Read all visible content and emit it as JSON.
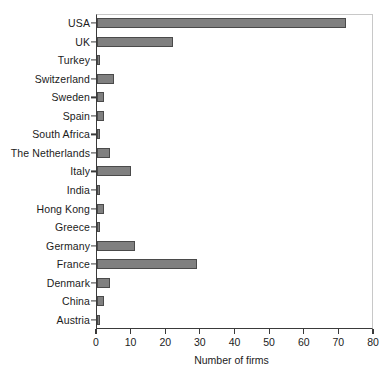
{
  "chart_data": {
    "type": "bar",
    "orientation": "horizontal",
    "title": "",
    "subtitle": "",
    "xlabel": "Number of firms",
    "ylabel": "",
    "xlim": [
      0,
      80
    ],
    "ylim": null,
    "xticks": [
      0,
      10,
      20,
      30,
      40,
      50,
      60,
      70,
      80
    ],
    "xtick_labels": [
      "0",
      "10",
      "20",
      "30",
      "40",
      "50",
      "60",
      "70",
      "80"
    ],
    "grid": false,
    "legend": null,
    "legend_position": "none",
    "annotations": [],
    "categories": [
      "USA",
      "UK",
      "Turkey",
      "Switzerland",
      "Sweden",
      "Spain",
      "South Africa",
      "The Netherlands",
      "Italy",
      "India",
      "Hong Kong",
      "Greece",
      "Germany",
      "France",
      "Denmark",
      "China",
      "Austria"
    ],
    "values": [
      72,
      22,
      1,
      5,
      2,
      2,
      1,
      4,
      10,
      1,
      2,
      1,
      11,
      29,
      4,
      2,
      1
    ],
    "series": [
      {
        "name": "Number of firms",
        "values": [
          72,
          22,
          1,
          5,
          2,
          2,
          1,
          4,
          10,
          1,
          2,
          1,
          11,
          29,
          4,
          2,
          1
        ]
      }
    ],
    "bar_fill_color": "#808080",
    "bar_edge_color": "#4a4a4a",
    "axis_color": "#3a3a3a",
    "background_color": "#ffffff"
  }
}
